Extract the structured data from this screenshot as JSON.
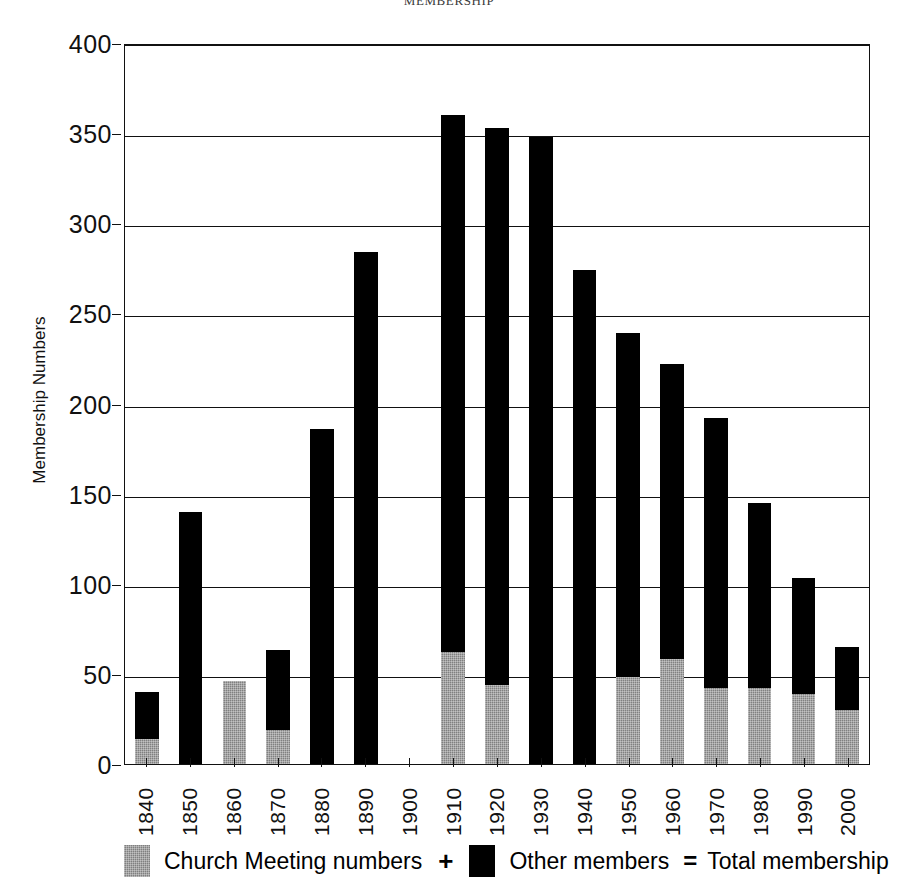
{
  "chart_data": {
    "type": "bar",
    "title": "MEMBERSHIP",
    "xlabel": "",
    "ylabel": "Membership Numbers",
    "ylim": [
      0,
      400
    ],
    "ytick_step": 50,
    "yticks": [
      "400",
      "350",
      "300",
      "250",
      "200",
      "150",
      "100",
      "50",
      "0"
    ],
    "grid": true,
    "stacked": true,
    "legend_position": "bottom",
    "categories": [
      "1840",
      "1850",
      "1860",
      "1870",
      "1880",
      "1890",
      "1900",
      "1910",
      "1920",
      "1930",
      "1940",
      "1950",
      "1960",
      "1970",
      "1980",
      "1990",
      "2000"
    ],
    "series": [
      {
        "name": "Church Meeting numbers",
        "color": "#808080",
        "values": [
          14,
          0,
          46,
          19,
          0,
          0,
          0,
          62,
          44,
          0,
          0,
          48,
          58,
          42,
          42,
          39,
          30
        ]
      },
      {
        "name": "Other members",
        "color": "#000000",
        "values": [
          26,
          140,
          0,
          44,
          186,
          284,
          0,
          298,
          309,
          348,
          274,
          191,
          164,
          150,
          103,
          64,
          35
        ]
      }
    ],
    "totals": [
      40,
      140,
      46,
      63,
      186,
      284,
      0,
      360,
      353,
      348,
      274,
      239,
      222,
      192,
      145,
      103,
      65
    ]
  },
  "legend": {
    "church_label": "Church Meeting numbers",
    "plus_symbol": "+",
    "other_label": "Other members",
    "equals_symbol": "=",
    "total_label": "Total membership"
  }
}
